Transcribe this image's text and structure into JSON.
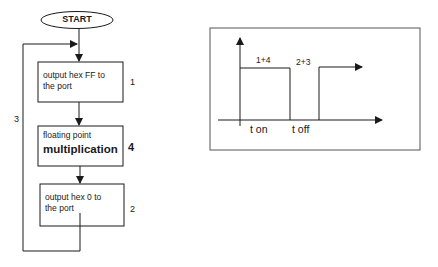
{
  "flowchart": {
    "start": {
      "label": "START"
    },
    "boxes": [
      {
        "id": "box-1",
        "lines": [
          "output hex FF to",
          "the port"
        ],
        "step": "1"
      },
      {
        "id": "box-4",
        "lines": [
          "floating point",
          "multiplication"
        ],
        "step": "4"
      },
      {
        "id": "box-2",
        "lines": [
          "output hex 0 to",
          "the port"
        ],
        "step": "2"
      }
    ],
    "loop_label": "3"
  },
  "timing": {
    "pulse_high_label": "1+4",
    "pulse_low_label": "2+3",
    "t_on_label": "t on",
    "t_off_label": "t off"
  },
  "colors": {
    "line": "#1a1a1a",
    "frame": "#555555",
    "background": "#ffffff"
  }
}
